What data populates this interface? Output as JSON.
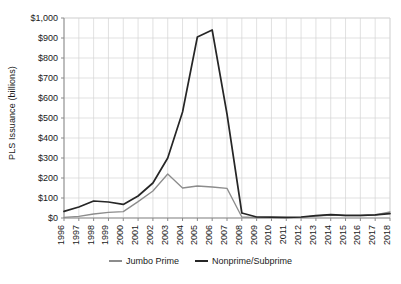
{
  "chart_data": {
    "type": "line",
    "title": "",
    "xlabel": "",
    "ylabel": "PLS Issuance (billions)",
    "ylim": [
      0,
      1000
    ],
    "ytick_labels": [
      "$0",
      "$100",
      "$200",
      "$300",
      "$400",
      "$500",
      "$600",
      "$700",
      "$800",
      "$900",
      "$1,000"
    ],
    "ytick_values": [
      0,
      100,
      200,
      300,
      400,
      500,
      600,
      700,
      800,
      900,
      1000
    ],
    "grid": true,
    "legend_position": "bottom",
    "categories": [
      "1996",
      "1997",
      "1998",
      "1999",
      "2000",
      "2001",
      "2002",
      "2003",
      "2004",
      "2005",
      "2006",
      "2007",
      "2008",
      "2009",
      "2010",
      "2011",
      "2012",
      "2013",
      "2014",
      "2015",
      "2016",
      "2017",
      "2018"
    ],
    "x": [
      1996,
      1997,
      1998,
      1999,
      2000,
      2001,
      2002,
      2003,
      2004,
      2005,
      2006,
      2007,
      2008,
      2009,
      2010,
      2011,
      2012,
      2013,
      2014,
      2015,
      2016,
      2017,
      2018
    ],
    "series": [
      {
        "name": "Jumbo Prime",
        "color": "#8c8c8c",
        "values": [
          3,
          8,
          20,
          28,
          32,
          82,
          135,
          220,
          150,
          160,
          155,
          148,
          5,
          2,
          2,
          2,
          3,
          10,
          15,
          12,
          12,
          15,
          30
        ]
      },
      {
        "name": "Nonprime/Subprime",
        "color": "#262626",
        "values": [
          33,
          55,
          85,
          80,
          68,
          110,
          175,
          300,
          530,
          905,
          940,
          520,
          25,
          5,
          4,
          3,
          5,
          12,
          17,
          13,
          13,
          16,
          22
        ]
      }
    ]
  },
  "axis": {
    "y_title": "PLS Issuance (billions)"
  },
  "legend": {
    "items": [
      {
        "label": "Jumbo Prime",
        "color": "#8c8c8c"
      },
      {
        "label": "Nonprime/Subprime",
        "color": "#262626"
      }
    ]
  },
  "caption": {
    "text": ""
  }
}
